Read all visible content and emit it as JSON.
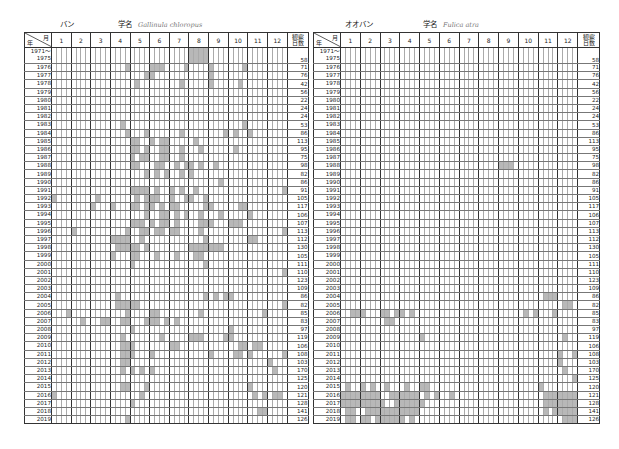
{
  "tables": [
    {
      "id": "ban",
      "name_jp": "バン",
      "sci_label": "学名",
      "sci_name": "Gallinula chloropus",
      "corner_month": "月",
      "corner_year": "年",
      "months": [
        "1",
        "2",
        "3",
        "4",
        "5",
        "6",
        "7",
        "8",
        "9",
        "10",
        "11",
        "12"
      ],
      "days_header": [
        "観察",
        "日数"
      ],
      "rows": [
        {
          "year": "1971～",
          "year2": "1975",
          "days": "58",
          "on": [
            28,
            29,
            30,
            31
          ]
        },
        {
          "year": "1976",
          "days": "71",
          "on": [
            15,
            20,
            21,
            22,
            27,
            32,
            39
          ]
        },
        {
          "year": "1977",
          "days": "76",
          "on": [
            19,
            20,
            32
          ]
        },
        {
          "year": "1978",
          "days": "42",
          "on": [
            17,
            26,
            32,
            38
          ]
        },
        {
          "year": "1979",
          "days": "56",
          "on": []
        },
        {
          "year": "1980",
          "days": "22",
          "on": []
        },
        {
          "year": "1981",
          "days": "24",
          "on": []
        },
        {
          "year": "1982",
          "days": "24",
          "on": []
        },
        {
          "year": "1983",
          "days": "53",
          "on": [
            14,
            39
          ]
        },
        {
          "year": "1984",
          "days": "86",
          "on": [
            15,
            19,
            26,
            35,
            37,
            40
          ]
        },
        {
          "year": "1985",
          "days": "113",
          "on": [
            16,
            17,
            20,
            22,
            23,
            29
          ]
        },
        {
          "year": "1986",
          "days": "95",
          "on": [
            16,
            17,
            19,
            22,
            23,
            26,
            30,
            37
          ]
        },
        {
          "year": "1987",
          "days": "75",
          "on": [
            16,
            18,
            19,
            22,
            23,
            26
          ]
        },
        {
          "year": "1988",
          "days": "98",
          "on": [
            16,
            17,
            21,
            22,
            25,
            27,
            28,
            30,
            33
          ]
        },
        {
          "year": "1989",
          "days": "82",
          "on": [
            19,
            21,
            23,
            26,
            28
          ]
        },
        {
          "year": "1990",
          "days": "86",
          "on": [
            34
          ]
        },
        {
          "year": "1991",
          "days": "91",
          "on": [
            16,
            17,
            18,
            19,
            21,
            24,
            26,
            29,
            47
          ]
        },
        {
          "year": "1992",
          "days": "105",
          "on": [
            0,
            9,
            17,
            19,
            20,
            21,
            24,
            27,
            28,
            31
          ]
        },
        {
          "year": "1993",
          "days": "117",
          "on": [
            8,
            12,
            16,
            17,
            19,
            20,
            22,
            24,
            25,
            31,
            32,
            38,
            39
          ]
        },
        {
          "year": "1994",
          "days": "106",
          "on": [
            19,
            22,
            23,
            25,
            27,
            30,
            34,
            40
          ]
        },
        {
          "year": "1995",
          "days": "107",
          "on": [
            16,
            17,
            18,
            20,
            22,
            23,
            25,
            30,
            31,
            32,
            36,
            37,
            38
          ]
        },
        {
          "year": "1996",
          "days": "113",
          "on": [
            4,
            15,
            18,
            19,
            21,
            22,
            24,
            25,
            30,
            47
          ]
        },
        {
          "year": "1997",
          "days": "112",
          "on": [
            12,
            13,
            14,
            15,
            18,
            31,
            40,
            41
          ]
        },
        {
          "year": "1998",
          "days": "130",
          "on": [
            13,
            14,
            15,
            16,
            17,
            19,
            28,
            29,
            30,
            31,
            32,
            33,
            34
          ]
        },
        {
          "year": "1999",
          "days": "105",
          "on": [
            12,
            16,
            17,
            21,
            25,
            29,
            30
          ]
        },
        {
          "year": "2000",
          "days": "111",
          "on": [
            16,
            31
          ]
        },
        {
          "year": "2001",
          "days": "110",
          "on": [
            47
          ]
        },
        {
          "year": "2002",
          "days": "123",
          "on": []
        },
        {
          "year": "2003",
          "days": "109",
          "on": []
        },
        {
          "year": "2004",
          "days": "86",
          "on": [
            13,
            31,
            33,
            35,
            36
          ]
        },
        {
          "year": "2005",
          "days": "82",
          "on": [
            13,
            14,
            15,
            16,
            17,
            47
          ]
        },
        {
          "year": "2006",
          "days": "85",
          "on": [
            3,
            15,
            20,
            21,
            30,
            43
          ]
        },
        {
          "year": "2007",
          "days": "83",
          "on": [
            6,
            10,
            11,
            14,
            15,
            19,
            20,
            21,
            23,
            25
          ]
        },
        {
          "year": "2008",
          "days": "97",
          "on": [
            16,
            36
          ]
        },
        {
          "year": "2009",
          "days": "119",
          "on": [
            14,
            22,
            28,
            29,
            30,
            35,
            36
          ]
        },
        {
          "year": "2010",
          "days": "106",
          "on": [
            14,
            15,
            16,
            24,
            25,
            38,
            39,
            41,
            42
          ]
        },
        {
          "year": "2011",
          "days": "108",
          "on": [
            14,
            15,
            16,
            20,
            32,
            37,
            38,
            40,
            47
          ]
        },
        {
          "year": "2012",
          "days": "103",
          "on": [
            14,
            15,
            44
          ]
        },
        {
          "year": "2013",
          "days": "170",
          "on": [
            14,
            16,
            18,
            20,
            45
          ]
        },
        {
          "year": "2014",
          "days": "125",
          "on": []
        },
        {
          "year": "2015",
          "days": "120",
          "on": [
            14,
            15,
            19,
            40
          ]
        },
        {
          "year": "2016",
          "days": "121",
          "on": [
            0,
            18,
            41,
            43,
            45,
            46
          ]
        },
        {
          "year": "2017",
          "days": "128",
          "on": [
            16
          ]
        },
        {
          "year": "2018",
          "days": "141",
          "on": [
            42,
            43
          ]
        },
        {
          "year": "2019",
          "days": "126",
          "on": [
            15
          ]
        }
      ]
    },
    {
      "id": "ooban",
      "name_jp": "オオバン",
      "sci_label": "学名",
      "sci_name": "Fulica atra",
      "corner_month": "月",
      "corner_year": "年",
      "months": [
        "1",
        "2",
        "3",
        "4",
        "5",
        "6",
        "7",
        "8",
        "9",
        "10",
        "11",
        "12"
      ],
      "days_header": [
        "観察",
        "日数"
      ],
      "rows": [
        {
          "year": "1971～",
          "year2": "1975",
          "days": "58",
          "on": []
        },
        {
          "year": "1976",
          "days": "71",
          "on": []
        },
        {
          "year": "1977",
          "days": "76",
          "on": []
        },
        {
          "year": "1978",
          "days": "42",
          "on": []
        },
        {
          "year": "1979",
          "days": "56",
          "on": []
        },
        {
          "year": "1980",
          "days": "22",
          "on": []
        },
        {
          "year": "1981",
          "days": "24",
          "on": []
        },
        {
          "year": "1982",
          "days": "24",
          "on": []
        },
        {
          "year": "1983",
          "days": "53",
          "on": []
        },
        {
          "year": "1984",
          "days": "86",
          "on": []
        },
        {
          "year": "1985",
          "days": "113",
          "on": []
        },
        {
          "year": "1986",
          "days": "95",
          "on": []
        },
        {
          "year": "1987",
          "days": "75",
          "on": []
        },
        {
          "year": "1988",
          "days": "98",
          "on": [
            32,
            33,
            34
          ]
        },
        {
          "year": "1989",
          "days": "82",
          "on": []
        },
        {
          "year": "1990",
          "days": "86",
          "on": []
        },
        {
          "year": "1991",
          "days": "91",
          "on": []
        },
        {
          "year": "1992",
          "days": "105",
          "on": []
        },
        {
          "year": "1993",
          "days": "117",
          "on": []
        },
        {
          "year": "1994",
          "days": "106",
          "on": []
        },
        {
          "year": "1995",
          "days": "107",
          "on": []
        },
        {
          "year": "1996",
          "days": "113",
          "on": []
        },
        {
          "year": "1997",
          "days": "112",
          "on": []
        },
        {
          "year": "1998",
          "days": "130",
          "on": []
        },
        {
          "year": "1999",
          "days": "105",
          "on": []
        },
        {
          "year": "2000",
          "days": "111",
          "on": []
        },
        {
          "year": "2001",
          "days": "110",
          "on": []
        },
        {
          "year": "2002",
          "days": "123",
          "on": []
        },
        {
          "year": "2003",
          "days": "109",
          "on": []
        },
        {
          "year": "2004",
          "days": "86",
          "on": [
            41,
            42,
            43
          ]
        },
        {
          "year": "2005",
          "days": "82",
          "on": [
            45,
            46
          ]
        },
        {
          "year": "2006",
          "days": "85",
          "on": [
            2,
            3,
            4,
            8,
            9,
            11,
            12,
            14,
            37,
            39,
            43
          ]
        },
        {
          "year": "2007",
          "days": "83",
          "on": [
            9,
            10
          ]
        },
        {
          "year": "2008",
          "days": "97",
          "on": []
        },
        {
          "year": "2009",
          "days": "119",
          "on": [
            16,
            45
          ]
        },
        {
          "year": "2010",
          "days": "106",
          "on": []
        },
        {
          "year": "2011",
          "days": "108",
          "on": [
            44,
            47
          ]
        },
        {
          "year": "2012",
          "days": "103",
          "on": [
            44
          ]
        },
        {
          "year": "2013",
          "days": "170",
          "on": [
            45
          ]
        },
        {
          "year": "2014",
          "days": "125",
          "on": [
            47
          ]
        },
        {
          "year": "2015",
          "days": "120",
          "on": [
            1,
            4,
            6,
            9,
            13,
            16,
            17,
            40
          ]
        },
        {
          "year": "2016",
          "days": "121",
          "on": [
            0,
            1,
            2,
            3,
            4,
            5,
            6,
            7,
            10,
            11,
            12,
            13,
            14,
            15,
            17,
            19,
            22,
            41,
            42,
            43,
            44,
            45,
            46,
            47
          ]
        },
        {
          "year": "2017",
          "days": "128",
          "on": [
            0,
            1,
            2,
            3,
            4,
            5,
            6,
            7,
            8,
            11,
            12,
            13,
            14,
            15,
            16,
            41,
            42,
            43,
            44,
            45,
            46,
            47
          ]
        },
        {
          "year": "2018",
          "days": "141",
          "on": [
            1,
            2,
            5,
            6,
            7,
            8,
            9,
            10,
            11,
            12,
            13,
            14,
            15,
            41,
            43,
            44,
            45,
            46,
            47
          ]
        },
        {
          "year": "2019",
          "days": "126",
          "on": [
            1,
            2,
            4,
            5,
            7,
            8,
            9,
            10,
            11,
            12,
            14,
            45,
            46,
            47
          ]
        }
      ]
    }
  ]
}
